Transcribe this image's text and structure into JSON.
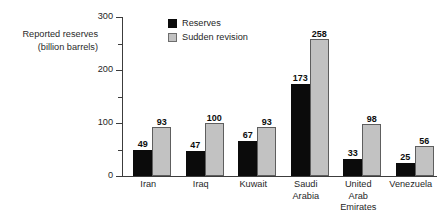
{
  "chart_data": {
    "type": "bar",
    "title": "",
    "xlabel": "",
    "ylabel": "Reported reserves (billion barrels)",
    "ylabel_lines": [
      "Reported reserves",
      "(billion barrels)"
    ],
    "ylim": [
      0,
      300
    ],
    "y_ticks": [
      0,
      100,
      200,
      300
    ],
    "y_tick_labels": [
      "0",
      "100",
      "200",
      "300"
    ],
    "y_minor_ticks": [
      50,
      150,
      250
    ],
    "grid": false,
    "legend_position": "top-left-inside",
    "categories": [
      "Iran",
      "Iraq",
      "Kuwait",
      "Saudi Arabia",
      "United Arab Emirates",
      "Venezuela"
    ],
    "category_label_lines": [
      [
        "Iran"
      ],
      [
        "Iraq"
      ],
      [
        "Kuwait"
      ],
      [
        "Saudi",
        "Arabia"
      ],
      [
        "United",
        "Arab",
        "Emirates"
      ],
      [
        "Venezuela"
      ]
    ],
    "series": [
      {
        "name": "Reserves",
        "color": "#0b0b0b",
        "values": [
          49,
          47,
          67,
          173,
          33,
          25
        ],
        "labels": [
          "49",
          "47",
          "67",
          "173",
          "33",
          "25"
        ]
      },
      {
        "name": "Sudden revision",
        "color": "#c2c2c2",
        "border_color": "#5e5e5e",
        "values": [
          93,
          100,
          93,
          258,
          98,
          56
        ],
        "labels": [
          "93",
          "100",
          "93",
          "258",
          "98",
          "56"
        ]
      }
    ]
  },
  "legend": {
    "items": [
      {
        "label": "Reserves",
        "swatch": "dark"
      },
      {
        "label": "Sudden revision",
        "swatch": "light"
      }
    ]
  },
  "colors": {
    "background": "#ffffff",
    "axis": "#3c3c3c",
    "text": "#1f1f1f",
    "reserves": "#0b0b0b",
    "revision_fill": "#c2c2c2",
    "revision_border": "#5e5e5e"
  }
}
